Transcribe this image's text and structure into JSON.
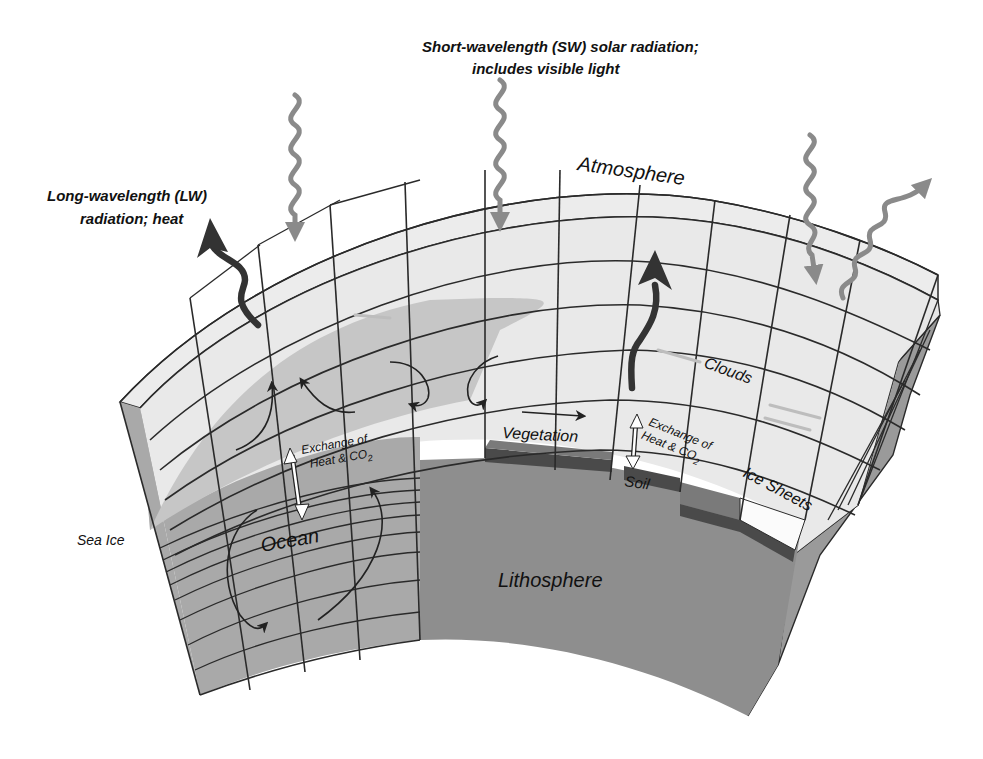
{
  "figure": {
    "labels": {
      "sw_radiation_line1": "Short-wavelength (SW) solar radiation;",
      "sw_radiation_line2": "includes visible light",
      "lw_radiation_line1": "Long-wavelength (LW)",
      "lw_radiation_line2": "radiation; heat",
      "atmosphere": "Atmosphere",
      "clouds": "Clouds",
      "vegetation": "Vegetation",
      "soil": "Soil",
      "ice_sheets": "Ice Sheets",
      "sea_ice": "Sea Ice",
      "ocean": "Ocean",
      "lithosphere": "Lithosphere",
      "exchange_ocean_line1": "Exchange of",
      "exchange_ocean_line2": "Heat & CO",
      "exchange_ocean_sub": "2",
      "exchange_land_line1": "Exchange of",
      "exchange_land_line2": "Heat & CO",
      "exchange_land_sub": "2"
    },
    "colors": {
      "background": "#ffffff",
      "atmosphere_fill": "#e9e9e9",
      "ocean_fill": "#a9a9a9",
      "ocean_light_fill": "#c6c6c6",
      "lithosphere_fill": "#8e8e8e",
      "lithosphere_side": "#9a9a9a",
      "soil_band": "#4a4a4a",
      "vegetation_band": "#7a7a7a",
      "ice_sheet_fill": "#fbfbfb",
      "grid_line": "#2a2a2a",
      "sw_arrow": "#8a8a8a",
      "lw_arrow": "#333333"
    },
    "arrows": {
      "sw_incoming_count": 3,
      "sw_reflected_count": 1,
      "lw_outgoing_count": 2,
      "ocean_circulation_arrows": 6,
      "exchange_double_arrows": 2
    }
  }
}
